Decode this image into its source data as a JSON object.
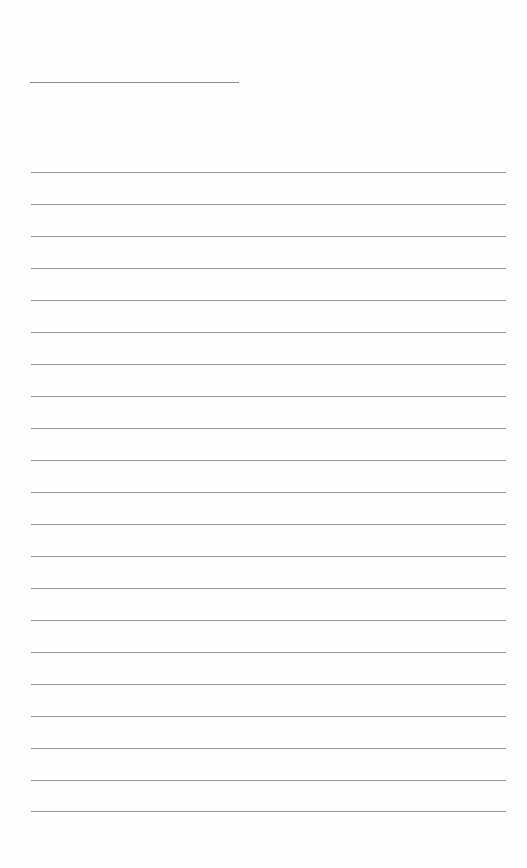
{
  "page": {
    "type": "blank-lined-writing-sheet",
    "background_color": "#fefefe",
    "line_color": "#9a9a9a",
    "title_line": {
      "x": 30,
      "y": 82,
      "width": 209,
      "color": "#8c8c8c"
    },
    "ruled_lines": {
      "count": 21,
      "x": 31,
      "width": 475,
      "first_y": 172,
      "spacing": 32,
      "positions_y": [
        172,
        204,
        236,
        268,
        300,
        332,
        364,
        396,
        428,
        460,
        492,
        524,
        556,
        588,
        620,
        652,
        684,
        716,
        748,
        780,
        811
      ]
    }
  }
}
